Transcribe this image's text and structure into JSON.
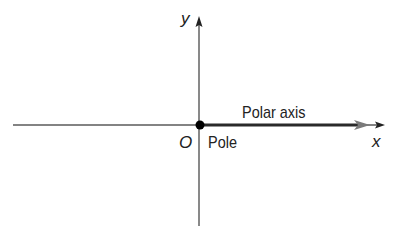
{
  "diagram": {
    "axes": {
      "x_label": "x",
      "y_label": "y",
      "origin_label": "O"
    },
    "pole_label": "Pole",
    "polar_axis_label": "Polar axis",
    "colors": {
      "axis": "#4a4a4a",
      "polar_axis": "#2a2a2a",
      "polar_arrow": "#7a7a7a",
      "pole_dot": "#000000",
      "text": "#222222",
      "background": "#ffffff"
    }
  }
}
